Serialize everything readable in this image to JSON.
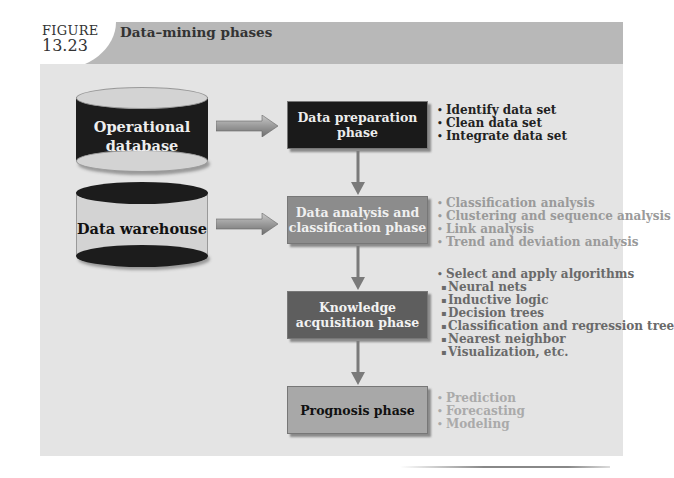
{
  "figure": {
    "label": "FIGURE",
    "number": "13.23",
    "title": "Data–mining phases"
  },
  "sources": [
    {
      "label": "Operational database",
      "line1": "Operational",
      "line2": "database"
    },
    {
      "label": "Data warehouse"
    }
  ],
  "phases": [
    {
      "line1": "Data preparation phase",
      "line2": "",
      "items": [
        "Identify data set",
        "Clean data set",
        "Integrate data set"
      ]
    },
    {
      "line1": "Data analysis and",
      "line2": "classification phase",
      "items": [
        "Classification analysis",
        "Clustering and sequence analysis",
        "Link analysis",
        "Trend and deviation analysis"
      ]
    },
    {
      "line1": "Knowledge",
      "line2": "acquisition phase",
      "items": [
        "Select and apply algorithms"
      ],
      "subitems": [
        "Neural nets",
        "Inductive logic",
        "Decision trees",
        "Classification and regression tree",
        "Nearest neighbor",
        "Visualization, etc."
      ]
    },
    {
      "line1": "Prognosis phase",
      "line2": "",
      "items": [
        "Prediction",
        "Forecasting",
        "Modeling"
      ]
    }
  ]
}
